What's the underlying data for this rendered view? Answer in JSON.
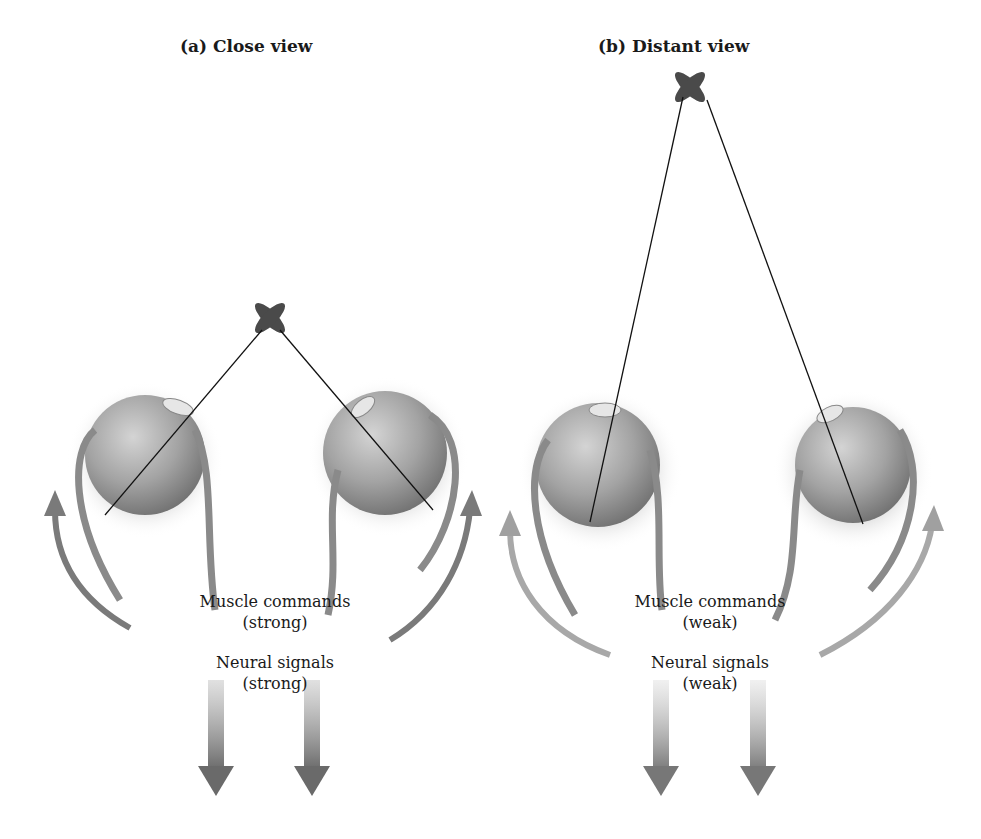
{
  "panels": [
    {
      "id": "a",
      "title": "(a) Close view",
      "muscle_label": "Muscle commands",
      "muscle_strength": "(strong)",
      "neural_label": "Neural signals",
      "neural_strength": "(strong)"
    },
    {
      "id": "b",
      "title": "(b) Distant view",
      "muscle_label": "Muscle commands",
      "muscle_strength": "(weak)",
      "neural_label": "Neural signals",
      "neural_strength": "(weak)"
    }
  ],
  "colors": {
    "eye_fill": "#9a9a9a",
    "arrow": "#7a7a7a",
    "target": "#4a4a4a",
    "line": "#111111"
  }
}
